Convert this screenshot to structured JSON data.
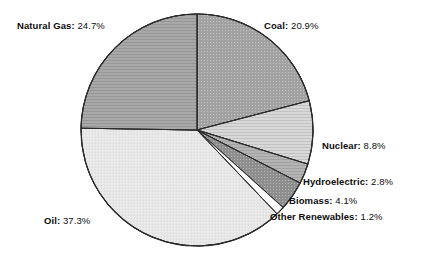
{
  "chart_data": {
    "type": "pie",
    "title": "",
    "subtitle": "",
    "xlabel": "",
    "ylabel": "",
    "legend_position": "none",
    "grid": false,
    "units": "percent",
    "start_angle_deg": 0,
    "direction": "clockwise",
    "categories": [
      "Coal",
      "Nuclear",
      "Hydroelectric",
      "Biomass",
      "Other Renewables",
      "Oil",
      "Natural Gas"
    ],
    "values": [
      20.9,
      8.8,
      2.8,
      4.1,
      1.2,
      37.3,
      24.7
    ],
    "slices": [
      {
        "name": "Coal",
        "value": 20.9,
        "label": "Coal:",
        "value_text": "20.9%",
        "color": "#a3a3a3"
      },
      {
        "name": "Nuclear",
        "value": 8.8,
        "label": "Nuclear:",
        "value_text": "8.8%",
        "color": "#d8d8d8"
      },
      {
        "name": "Hydroelectric",
        "value": 2.8,
        "label": "Hydroelectric:",
        "value_text": "2.8%",
        "color": "#b4b4b4"
      },
      {
        "name": "Biomass",
        "value": 4.1,
        "label": "Biomass:",
        "value_text": "4.1%",
        "color": "#8f8f8f"
      },
      {
        "name": "Other Renewables",
        "value": 1.2,
        "label": "Other Renewables:",
        "value_text": "1.2%",
        "color": "#fcfcfc"
      },
      {
        "name": "Oil",
        "value": 37.3,
        "label": "Oil:",
        "value_text": "37.3%",
        "color": "#e7e7e7"
      },
      {
        "name": "Natural Gas",
        "value": 24.7,
        "label": "Natural Gas:",
        "value_text": "24.7%",
        "color": "#a8a8a8"
      }
    ],
    "geometry": {
      "cx": 197,
      "cy": 130,
      "r": 116
    },
    "stroke_color": "#2b2b2b"
  },
  "labels": {
    "natural_gas": {
      "key": "Natural Gas:",
      "value": "24.7%"
    },
    "coal": {
      "key": "Coal:",
      "value": "20.9%"
    },
    "nuclear": {
      "key": "Nuclear:",
      "value": "8.8%"
    },
    "hydro": {
      "key": "Hydroelectric:",
      "value": "2.8%"
    },
    "biomass": {
      "key": "Biomass:",
      "value": "4.1%"
    },
    "other": {
      "key": "Other Renewables:",
      "value": "1.2%"
    },
    "oil": {
      "key": "Oil:",
      "value": "37.3%"
    }
  }
}
